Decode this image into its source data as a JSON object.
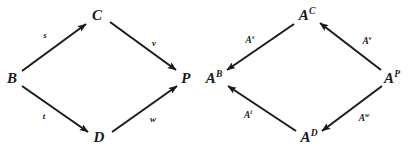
{
  "figure": {
    "kind": "commutative-diagram-pair",
    "width": 409,
    "height": 149,
    "background_color": "#ffffff",
    "ink_color": "#1a1a1a"
  },
  "diagrams": [
    {
      "id": "left",
      "name": "pushout-square",
      "nodes": [
        {
          "id": "B",
          "label": "B",
          "sup": "",
          "x": 12,
          "y": 78
        },
        {
          "id": "C",
          "label": "C",
          "sup": "",
          "x": 97,
          "y": 15
        },
        {
          "id": "D",
          "label": "D",
          "sup": "",
          "x": 99,
          "y": 137
        },
        {
          "id": "P",
          "label": "P",
          "sup": "",
          "x": 186,
          "y": 78
        }
      ],
      "edges": [
        {
          "id": "s",
          "label": "s",
          "sup": "",
          "from": "B",
          "to": "C",
          "x1": 22,
          "y1": 71,
          "x2": 86,
          "y2": 24,
          "lx": 45,
          "ly": 35
        },
        {
          "id": "v",
          "label": "v",
          "sup": "",
          "from": "C",
          "to": "P",
          "x1": 110,
          "y1": 22,
          "x2": 176,
          "y2": 70,
          "lx": 154,
          "ly": 43
        },
        {
          "id": "t",
          "label": "t",
          "sup": "",
          "from": "B",
          "to": "D",
          "x1": 22,
          "y1": 86,
          "x2": 88,
          "y2": 132,
          "lx": 44,
          "ly": 116
        },
        {
          "id": "w",
          "label": "w",
          "sup": "",
          "from": "D",
          "to": "P",
          "x1": 112,
          "y1": 132,
          "x2": 177,
          "y2": 86,
          "lx": 153,
          "ly": 119
        }
      ]
    },
    {
      "id": "right",
      "name": "contravariant-image-square",
      "nodes": [
        {
          "id": "AB",
          "label": "A",
          "sup": "B",
          "x": 214,
          "y": 78
        },
        {
          "id": "AC",
          "label": "A",
          "sup": "C",
          "x": 307,
          "y": 15
        },
        {
          "id": "AD",
          "label": "A",
          "sup": "D",
          "x": 309,
          "y": 137
        },
        {
          "id": "AP",
          "label": "A",
          "sup": "P",
          "x": 392,
          "y": 78
        }
      ],
      "edges": [
        {
          "id": "As",
          "label": "A",
          "sup": "s",
          "from": "AC",
          "to": "AB",
          "x1": 294,
          "y1": 24,
          "x2": 227,
          "y2": 70,
          "lx": 250,
          "ly": 41
        },
        {
          "id": "Av",
          "label": "A",
          "sup": "v",
          "from": "AP",
          "to": "AC",
          "x1": 381,
          "y1": 70,
          "x2": 320,
          "y2": 23,
          "lx": 367,
          "ly": 42
        },
        {
          "id": "At",
          "label": "A",
          "sup": "t",
          "from": "AD",
          "to": "AB",
          "x1": 296,
          "y1": 131,
          "x2": 228,
          "y2": 86,
          "lx": 248,
          "ly": 116
        },
        {
          "id": "Aw",
          "label": "A",
          "sup": "w",
          "from": "AP",
          "to": "AD",
          "x1": 382,
          "y1": 86,
          "x2": 322,
          "y2": 131,
          "lx": 364,
          "ly": 119
        }
      ]
    }
  ],
  "style": {
    "stroke_width": 2.0,
    "arrowhead_length": 9,
    "arrowhead_width": 6
  }
}
